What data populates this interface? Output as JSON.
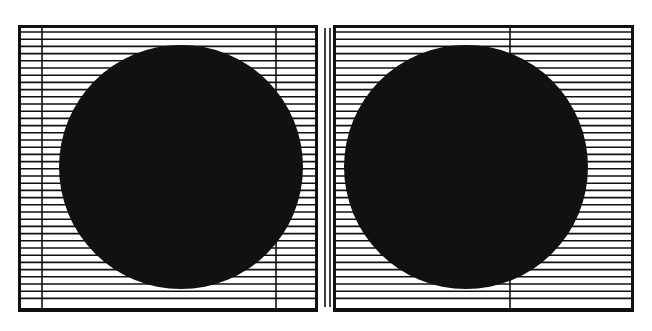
{
  "figure": {
    "type": "optical-illusion-diagram",
    "background": "#ffffff",
    "ink_color": "#111111",
    "line_spacing_px": 7.2,
    "divider": {
      "x1": 325,
      "x2": 330,
      "y_top": 28,
      "y_bottom": 307
    },
    "panels": [
      {
        "id": "left",
        "frame": {
          "x": 18,
          "y": 25,
          "width": 300,
          "height": 287
        },
        "inner_top": 32,
        "inner_bottom": 304,
        "vertical_lines": [
          42,
          276
        ],
        "circle": {
          "cx": 181,
          "cy": 167,
          "r": 122
        }
      },
      {
        "id": "right",
        "frame": {
          "x": 333,
          "y": 25,
          "width": 301,
          "height": 287
        },
        "inner_top": 32,
        "inner_bottom": 304,
        "vertical_lines": [
          510
        ],
        "circle": {
          "cx": 466,
          "cy": 167,
          "r": 122
        }
      }
    ]
  }
}
